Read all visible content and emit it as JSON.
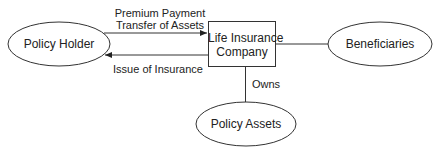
{
  "nodes": {
    "policy_holder": "Policy Holder",
    "company_line1": "Life Insurance",
    "company_line2": "Company",
    "beneficiaries": "Beneficiaries",
    "policy_assets": "Policy Assets"
  },
  "edges": {
    "premium_line1": "Premium Payment",
    "premium_line2": "Transfer of Assets",
    "issue": "Issue of Insurance",
    "owns": "Owns"
  },
  "colors": {
    "stroke": "#333333",
    "background": "#ffffff"
  }
}
